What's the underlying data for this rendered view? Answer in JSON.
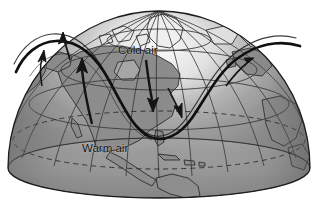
{
  "figure": {
    "kind": "globe-diagram",
    "background_color": "#ffffff",
    "title_visible": false,
    "projection": "orthographic-north-polar-dome",
    "view_width": 317,
    "view_height": 211
  },
  "globe": {
    "name": "northern-hemisphere-dome",
    "ocean_color": "#9a9a9a",
    "land_color": "#8e8e8e",
    "polar_cap_color": "#f2f2f2",
    "outline_color": "#1d1d1d",
    "base_ellipse": {
      "center_x": 159,
      "center_y": 168,
      "radius_x": 151,
      "radius_y": 30
    },
    "dome": {
      "apex_y": 11,
      "left_x": 8,
      "right_x": 310
    },
    "shading": {
      "highlight": "#e8e8e8",
      "shadow": "#6f6f6f"
    }
  },
  "graticule": {
    "name": "latitude-longitude-grid",
    "line_color": "#3a3a3a",
    "latitude_count": 5,
    "longitude_count": 13,
    "dashed_latitude": {
      "name": "tropic-of-cancer",
      "dashed": true,
      "screen_y": 140
    }
  },
  "jet_stream": {
    "name": "polar-jet-stream-wave",
    "color": "#121212",
    "stroke_width": 2.6,
    "description": "Rossby wave with deep trough over North America",
    "trough_bottom_x": 160,
    "trough_bottom_y": 137,
    "left_ridge_x": 44,
    "left_ridge_y": 44,
    "right_ridge_x": 278,
    "right_ridge_y": 40
  },
  "annotations": {
    "cold_air": {
      "label": "Cold air",
      "x": 118,
      "y": 50,
      "arrow": {
        "name": "cold-air-arrow",
        "direction": "down",
        "color": "#1b1b1b",
        "tail_x": 148,
        "tail_y": 60,
        "head_x": 152,
        "head_y": 104
      }
    },
    "warm_air": {
      "label": "Warm air",
      "x": 82,
      "y": 148,
      "arrow": {
        "name": "warm-air-arrow",
        "direction": "up",
        "color": "#1b1b1b",
        "tail_x": 90,
        "tail_y": 120,
        "head_x": 82,
        "head_y": 62
      }
    },
    "secondary_arrows": [
      {
        "name": "jet-flow-arrow-left",
        "x": 64,
        "y": 44,
        "direction": "up-right"
      },
      {
        "name": "jet-flow-arrow-center",
        "x": 172,
        "y": 104,
        "direction": "down-right"
      },
      {
        "name": "jet-flow-arrow-right",
        "x": 232,
        "y": 76,
        "direction": "up-right"
      }
    ]
  },
  "landmasses": [
    {
      "name": "north-america",
      "visible": true
    },
    {
      "name": "greenland",
      "visible": true
    },
    {
      "name": "central-america",
      "visible": true
    },
    {
      "name": "south-america-north",
      "visible": true
    },
    {
      "name": "caribbean-islands",
      "visible": true
    },
    {
      "name": "alaska",
      "visible": true
    },
    {
      "name": "siberia-eastern",
      "visible": true
    },
    {
      "name": "europe-western",
      "visible": true
    },
    {
      "name": "africa-northwest",
      "visible": true
    }
  ]
}
